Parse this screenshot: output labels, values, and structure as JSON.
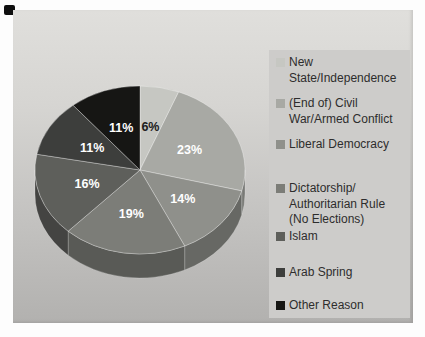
{
  "figure": {
    "bg_top": "#e0dfdc",
    "bg_bottom": "#b2b1af",
    "legend_panel_bg": "#cdccca",
    "legend_text_color": "#2d2d2d"
  },
  "chart_data": {
    "type": "pie",
    "style": "3d",
    "title": "",
    "legend_position": "right",
    "start_angle_deg": 0,
    "labels": [
      "New State/Independence",
      "(End of) Civil War/Armed Conflict",
      "Liberal Democracy",
      "Dictatorship/Authoritarian Rule (No Elections)",
      "Islam",
      "Arab Spring",
      "Other Reason"
    ],
    "label_lines": [
      [
        "New",
        "State/Independence"
      ],
      [
        "(End of) Civil",
        "War/Armed Conflict"
      ],
      [
        "Liberal Democracy"
      ],
      [
        "Dictatorship/",
        "Authoritarian Rule",
        "(No Elections)"
      ],
      [
        "Islam"
      ],
      [
        "Arab Spring"
      ],
      [
        "Other Reason"
      ]
    ],
    "values": [
      6,
      23,
      14,
      19,
      16,
      11,
      11
    ],
    "value_labels": [
      "6%",
      "23%",
      "14%",
      "19%",
      "16%",
      "11%",
      "11%"
    ],
    "colors": [
      "#c6c7c2",
      "#a8a9a4",
      "#8f908b",
      "#7c7d78",
      "#5e5f5b",
      "#3d3e3c",
      "#161614"
    ],
    "pct_label_colors": [
      "#1c1c1c",
      "#ffffff",
      "#ffffff",
      "#ffffff",
      "#ffffff",
      "#ffffff",
      "#ffffff"
    ]
  }
}
